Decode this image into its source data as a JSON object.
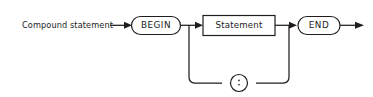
{
  "diagram": {
    "kind": "railroad-syntax-diagram",
    "title": "Compound statement",
    "background_color": "#ffffff",
    "line_color": "#211d1e",
    "entry_label": "Compound statement",
    "nodes": {
      "begin": {
        "label": "BEGIN",
        "shape": "oval",
        "type": "terminal"
      },
      "statement": {
        "label": "Statement",
        "shape": "rectangle",
        "type": "nonterminal"
      },
      "end": {
        "label": "END",
        "shape": "oval",
        "type": "terminal"
      },
      "separator": {
        "label": ";",
        "shape": "circle",
        "type": "terminal"
      }
    },
    "sequence": [
      "Compound statement",
      "BEGIN",
      "Statement",
      "END"
    ],
    "loop": {
      "from": "Statement",
      "through": ";",
      "back_to": "Statement"
    }
  }
}
